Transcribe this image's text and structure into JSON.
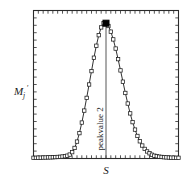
{
  "figure": {
    "background_color": "#ffffff",
    "frame_color": "#2b2b2b",
    "curve_color": "#1a1a1a",
    "marker_face_color": "#ffffff",
    "marker_edge_color": "#1a1a1a",
    "peak_marker_color": "#000000"
  },
  "labels": {
    "ylabel_main": "M",
    "ylabel_sub": "j",
    "ylabel_prime": "′",
    "xlabel": "S",
    "peak_annotation": "peakvalue 2"
  },
  "chart_data": {
    "type": "line",
    "title": "",
    "xlabel": "S",
    "ylabel": "Mⱼ′",
    "grid": false,
    "legend": null,
    "xlim": [
      0,
      60
    ],
    "ylim": [
      0,
      1.05
    ],
    "axis_ticks": {
      "x_tick_count": 30,
      "y_tick_count": 20,
      "tick_direction": "in",
      "tick_labels_shown": false
    },
    "annotations": [
      {
        "text": "peakvalue 2",
        "rotation": 90,
        "x": 30,
        "y_from": 0.0,
        "y_to": 0.96,
        "style": "vertical-line-with-rotated-label"
      }
    ],
    "peak_point": {
      "x": 30,
      "y": 0.96,
      "marker": "filled-square"
    },
    "marker_style": "open-square",
    "x": [
      0,
      1,
      2,
      3,
      4,
      5,
      6,
      7,
      8,
      9,
      10,
      11,
      12,
      13,
      14,
      15,
      16,
      17,
      18,
      19,
      20,
      21,
      22,
      23,
      24,
      25,
      26,
      27,
      28,
      29,
      30,
      31,
      32,
      33,
      34,
      35,
      36,
      37,
      38,
      39,
      40,
      41,
      42,
      43,
      44,
      45,
      46,
      47,
      48,
      49,
      50,
      51,
      52,
      53,
      54,
      55,
      56,
      57,
      58,
      59,
      60
    ],
    "values": [
      0.005,
      0.005,
      0.006,
      0.006,
      0.007,
      0.007,
      0.008,
      0.008,
      0.009,
      0.01,
      0.011,
      0.012,
      0.014,
      0.016,
      0.02,
      0.028,
      0.045,
      0.075,
      0.12,
      0.18,
      0.255,
      0.34,
      0.43,
      0.525,
      0.62,
      0.715,
      0.8,
      0.875,
      0.93,
      0.96,
      0.96,
      0.94,
      0.9,
      0.845,
      0.78,
      0.705,
      0.625,
      0.545,
      0.465,
      0.39,
      0.32,
      0.258,
      0.205,
      0.16,
      0.122,
      0.092,
      0.068,
      0.05,
      0.037,
      0.027,
      0.02,
      0.016,
      0.013,
      0.011,
      0.009,
      0.008,
      0.007,
      0.006,
      0.006,
      0.005,
      0.005
    ]
  }
}
